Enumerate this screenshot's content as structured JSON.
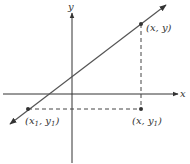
{
  "diagram": {
    "type": "coordinate-plane-slope",
    "colors": {
      "axis": "#333333",
      "line": "#555555",
      "dashed": "#444444",
      "point": "#333333",
      "text": "#333333"
    },
    "axes": {
      "x_label": "x",
      "y_label": "y"
    },
    "points": [
      {
        "id": "p2",
        "label": "(x, y)"
      },
      {
        "id": "p1",
        "label_base": "(x",
        "label_sub1": "1",
        "label_mid": ", y",
        "label_sub2": "1",
        "label_end": ")"
      },
      {
        "id": "p3",
        "label_base": "(x, y",
        "label_sub": "1",
        "label_end": ")"
      }
    ],
    "line": {
      "description": "straight line with positive slope through (x1, y1) and (x, y)"
    },
    "dashed_segments": [
      {
        "from": "(x1, y1)",
        "to": "(x, y1)",
        "orientation": "horizontal"
      },
      {
        "from": "(x, y)",
        "to": "(x, y1)",
        "orientation": "vertical"
      }
    ]
  }
}
